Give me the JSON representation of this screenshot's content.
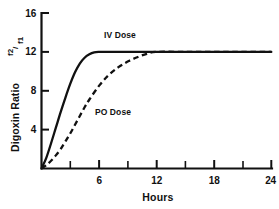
{
  "chart_data": {
    "type": "line",
    "title": "",
    "xlabel": "Hours",
    "ylabel": "Digoxin Ratio f2/f1",
    "ylabel_parts": {
      "text": "Digoxin Ratio",
      "numerator": "f2",
      "slash": "/",
      "denominator": "f1"
    },
    "xlim": [
      0,
      24
    ],
    "ylim": [
      0,
      16
    ],
    "grid": false,
    "legend_position": "inline-annotations",
    "x_ticks": [
      0,
      3,
      6,
      9,
      12,
      15,
      18,
      21,
      24
    ],
    "x_tick_labels": [
      "",
      "",
      "6",
      "",
      "12",
      "",
      "18",
      "",
      "24"
    ],
    "y_ticks": [
      0,
      4,
      8,
      12,
      16
    ],
    "y_tick_labels": [
      "",
      "4",
      "8",
      "12",
      "16"
    ],
    "series": [
      {
        "name": "IV Dose",
        "style": "solid",
        "color": "#111111",
        "annotation": "IV Dose",
        "x": [
          0,
          0.5,
          1,
          1.5,
          2,
          2.5,
          3,
          3.5,
          4,
          4.5,
          5,
          5.5,
          6,
          7,
          9,
          12,
          15,
          18,
          21,
          24
        ],
        "values": [
          0,
          1.1,
          2.6,
          4.2,
          5.8,
          7.3,
          8.7,
          9.9,
          10.8,
          11.4,
          11.75,
          11.95,
          12,
          12,
          12,
          12,
          12,
          12,
          12,
          12
        ]
      },
      {
        "name": "PO Dose",
        "style": "dashed",
        "color": "#111111",
        "annotation": "PO Dose",
        "x": [
          0,
          0.5,
          1,
          1.5,
          2,
          2.5,
          3,
          3.5,
          4,
          4.5,
          5,
          6,
          7,
          8,
          9,
          10,
          11,
          12,
          15,
          18,
          21,
          24
        ],
        "values": [
          0,
          0.35,
          0.8,
          1.35,
          2.0,
          2.8,
          3.6,
          4.5,
          5.4,
          6.3,
          7.1,
          8.5,
          9.6,
          10.4,
          11.0,
          11.45,
          11.8,
          12,
          12,
          12,
          12,
          12
        ]
      }
    ],
    "annotations": [
      {
        "text": "IV Dose",
        "x_hours": 8.8,
        "y_value": 13.1
      },
      {
        "text": "PO Dose",
        "x_hours": 8.2,
        "y_value": 5.4
      }
    ]
  }
}
